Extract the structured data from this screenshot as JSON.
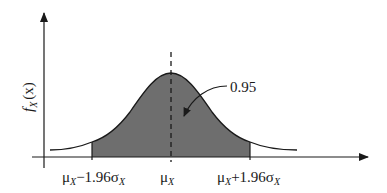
{
  "figure": {
    "type": "normal-distribution-confidence-interval",
    "y_axis_label": {
      "main": "f",
      "sub": "X",
      "arg": "(x)"
    },
    "area_label": "0.95",
    "x_labels": {
      "left": {
        "mu": "μ",
        "sub": "X",
        "rest": "−1.96σ",
        "sub2": "X"
      },
      "center": {
        "mu": "μ",
        "sub": "X"
      },
      "right": {
        "mu": "μ",
        "sub": "X",
        "rest": "+1.96σ",
        "sub2": "X"
      }
    },
    "colors": {
      "shade": "#6e6e6e",
      "line": "#1a1a1a"
    }
  }
}
